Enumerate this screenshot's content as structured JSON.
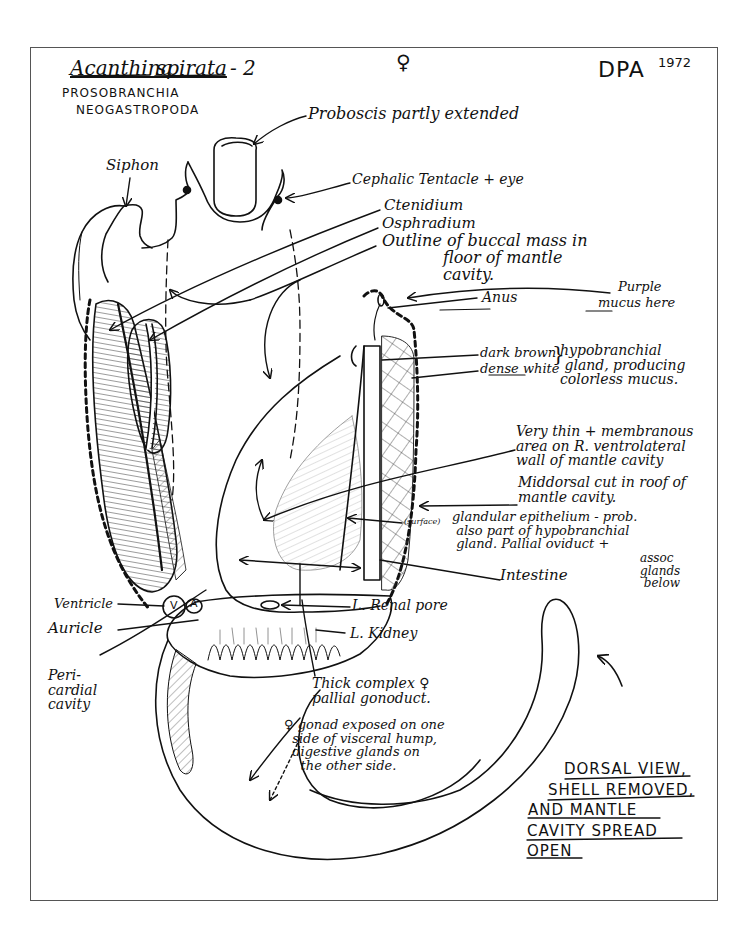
{
  "header": {
    "title_genus": "Acanthina",
    "title_species": "spirata",
    "title_suffix": "- 2",
    "sex_symbol": "♀",
    "author": "DPA",
    "year": "1972",
    "taxonomy": [
      "PROSOBRANCHIA",
      "NEOGASTROPODA"
    ]
  },
  "labels": {
    "proboscis": "Proboscis partly extended",
    "siphon": "Siphon",
    "cephalic_tentacle": "Cephalic Tentacle + eye",
    "ctenidium": "Ctenidium",
    "osphradium": "Osphradium",
    "buccal_outline": "Outline of buccal mass in\n            floor of mantle\n            cavity.",
    "anus": "Anus",
    "purple_mucus_1": "Purple",
    "purple_mucus_2": "mucus here",
    "dark_brown": "dark brown",
    "dense_white": "dense white",
    "hypobranchial": "hypobranchial\n gland, producing\ncolorless mucus.",
    "membranous_area": "Very thin + membranous\narea on R. ventrolateral\nwall of mantle cavity",
    "middorsal_cut": "Middorsal cut in roof of\nmantle cavity.",
    "surface_tag": "(surface)",
    "glandular_epithelium": "glandular epithelium - prob.\n also part of hypobranchial\n gland. Pallial oviduct +",
    "assoc_glands": "assoc\nglands\n below",
    "intestine": "Intestine",
    "ventricle": "Ventricle",
    "auricle": "Auricle",
    "v_mark": "V",
    "a_mark": "A",
    "renal_pore": "L. Renal pore",
    "kidney": "L. Kidney",
    "pericardial": "Peri-\ncardial\ncavity",
    "gonoduct": "Thick complex ♀\npallial gonoduct.",
    "gonad": "♀ gonad exposed on one\n  side of visceral hump,\n  digestive glands on\n    the other side."
  },
  "caption": {
    "lines": [
      "DORSAL VIEW,",
      "SHELL REMOVED,",
      "AND MANTLE",
      "CAVITY SPREAD",
      "OPEN"
    ]
  },
  "colors": {
    "ink": "#111111",
    "frame": "#555555",
    "paper": "#ffffff"
  }
}
